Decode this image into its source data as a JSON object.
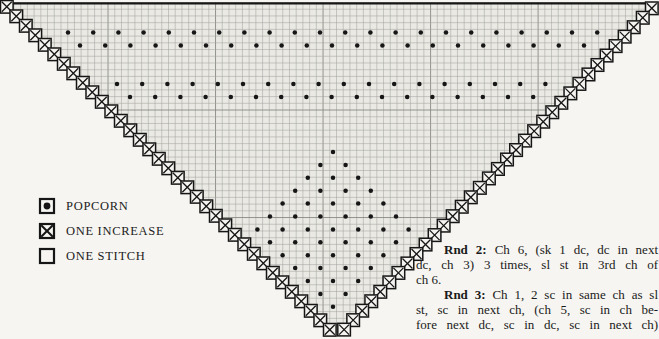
{
  "legend": {
    "items": [
      {
        "symbol": "popcorn",
        "label": "POPCORN"
      },
      {
        "symbol": "one-increase",
        "label": "ONE INCREASE"
      },
      {
        "symbol": "one-stitch",
        "label": "ONE STITCH"
      }
    ]
  },
  "instructions": {
    "lines": [
      {
        "bold": "Rnd 2:",
        "rest": " Ch 6, (sk 1 dc, dc in next"
      },
      {
        "bold": "",
        "rest": "dc, ch 3) 3 times, sl st in 3rd ch of"
      },
      {
        "bold": "",
        "rest": "ch 6."
      },
      {
        "bold": "Rnd 3:",
        "rest": " Ch 1, 2 sc in same ch as sl"
      },
      {
        "bold": "",
        "rest": "st, sc in next ch, (ch 5, sc in ch be-"
      },
      {
        "bold": "",
        "rest": "fore next dc, sc in dc, sc in next ch)"
      }
    ]
  },
  "chart_data": {
    "type": "stitch-chart",
    "canvas": {
      "w": 659,
      "h": 339
    },
    "colors": {
      "paper": "#f6f5f1",
      "grid_fill": "#eae9e4",
      "grid_minor": "#a5a5a0",
      "grid_major": "#84847e",
      "ink": "#161616",
      "box_fill": "#f4f3ef"
    },
    "grid": {
      "cell": 6.72,
      "major_every": 16,
      "top_y": 2.5,
      "triangle": [
        [
          1,
          2
        ],
        [
          657,
          2
        ],
        [
          338,
          334
        ]
      ],
      "top_border": {
        "x1": 11,
        "y": 3.4,
        "x2": 646
      }
    },
    "increase_chains": {
      "box_size": 12.6,
      "left": {
        "x0": 0.5,
        "y0": 0.5,
        "dx": 9.5,
        "dy": 9.5,
        "count": 35
      },
      "right": {
        "x0": 645.5,
        "y0": 2.0,
        "dx": -9.05,
        "dy": 9.45,
        "count": 35
      }
    },
    "popcorn_dots": {
      "radius": 2.25,
      "step_x": 25.2,
      "rows": [
        {
          "y": 32.5,
          "x0": 68,
          "n": 22
        },
        {
          "y": 45.5,
          "x0": 80,
          "n": 21
        },
        {
          "y": 84,
          "x0": 117,
          "n": 18
        },
        {
          "y": 97,
          "x0": 130,
          "n": 17
        },
        {
          "y": 152,
          "x0": 333,
          "n": 1
        },
        {
          "y": 164.9,
          "x0": 320.4,
          "n": 2
        },
        {
          "y": 177.8,
          "x0": 307.8,
          "n": 3
        },
        {
          "y": 190.7,
          "x0": 295.2,
          "n": 4
        },
        {
          "y": 203.6,
          "x0": 282.6,
          "n": 5
        },
        {
          "y": 216.5,
          "x0": 270,
          "n": 6
        },
        {
          "y": 229.4,
          "x0": 257.4,
          "n": 7
        },
        {
          "y": 242.3,
          "x0": 270,
          "n": 6
        },
        {
          "y": 255.2,
          "x0": 282.6,
          "n": 5
        },
        {
          "y": 268.1,
          "x0": 295.2,
          "n": 4
        },
        {
          "y": 281,
          "x0": 307.8,
          "n": 3
        },
        {
          "y": 293.9,
          "x0": 320.4,
          "n": 2
        },
        {
          "y": 306.8,
          "x0": 333,
          "n": 1
        }
      ]
    }
  }
}
